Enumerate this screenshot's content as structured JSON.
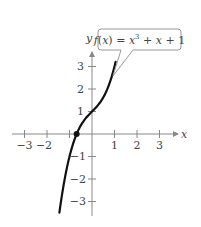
{
  "chart_data": {
    "type": "line",
    "title": "",
    "function_label": "f(x) = x³ + x + 1",
    "xlabel": "x",
    "ylabel": "y",
    "xlim": [
      -3.5,
      3.5
    ],
    "ylim": [
      -3.5,
      3.5
    ],
    "x_ticks": [
      -3,
      -2,
      -1,
      1,
      2,
      3
    ],
    "x_tick_labels": [
      "−3",
      "−2",
      "",
      "1",
      "2",
      "3"
    ],
    "y_ticks": [
      -3,
      -2,
      -1,
      1,
      2,
      3
    ],
    "y_tick_labels": [
      "−3",
      "−2",
      "−1",
      "1",
      "2",
      "3"
    ],
    "grid": false,
    "series": [
      {
        "name": "f(x) = x³ + x + 1",
        "x": [
          -1.45,
          -1.3,
          -1.1,
          -0.9,
          -0.682,
          -0.5,
          -0.3,
          0,
          0.3,
          0.5,
          0.7,
          0.9,
          1.05
        ],
        "y": [
          -3.5,
          -2.5,
          -1.43,
          -0.63,
          0,
          0.375,
          0.673,
          1,
          1.327,
          1.625,
          2.043,
          2.629,
          3.21
        ]
      }
    ],
    "annotations": [
      {
        "type": "point",
        "x": -0.682,
        "y": 0,
        "label": "real zero"
      }
    ]
  },
  "colors": {
    "axis": "#888888",
    "curve": "#111111",
    "text": "#444444",
    "callout_border": "#999999"
  }
}
